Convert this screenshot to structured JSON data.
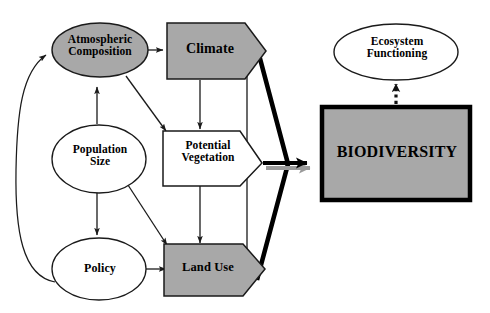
{
  "diagram": {
    "width": 490,
    "height": 313,
    "background_color": "#ffffff",
    "shape_fill_gray": "#a8a8a8",
    "shape_fill_white": "#ffffff",
    "stroke_color": "#000000",
    "accent_black": "#000000",
    "shadow_gray": "#9a9a9a"
  },
  "nodes": {
    "atmospheric_composition": {
      "label": "Atmospheric\nComposition",
      "shape": "ellipse",
      "fill": "#a8a8a8"
    },
    "population_size": {
      "label": "Population\nSize",
      "shape": "ellipse",
      "fill": "#ffffff"
    },
    "policy": {
      "label": "Policy",
      "shape": "ellipse",
      "fill": "#ffffff"
    },
    "climate": {
      "label": "Climate",
      "shape": "pentagon-arrow",
      "fill": "#a8a8a8"
    },
    "potential_vegetation": {
      "label": "Potential\nVegetation",
      "shape": "pentagon-arrow",
      "fill": "#ffffff"
    },
    "land_use": {
      "label": "Land Use",
      "shape": "pentagon-arrow",
      "fill": "#a8a8a8"
    },
    "biodiversity": {
      "label": "BIODIVERSITY",
      "shape": "rectangle",
      "fill": "#a8a8a8"
    },
    "ecosystem_functioning": {
      "label": "Ecosystem\nFunctioning",
      "shape": "ellipse",
      "fill": "#ffffff"
    }
  },
  "edges": [
    {
      "from": "atmospheric_composition",
      "to": "climate",
      "style": "solid-arrow"
    },
    {
      "from": "atmospheric_composition",
      "to": "potential_vegetation",
      "style": "solid-arrow"
    },
    {
      "from": "population_size",
      "to": "atmospheric_composition",
      "style": "solid-arrow"
    },
    {
      "from": "population_size",
      "to": "policy",
      "style": "solid-arrow"
    },
    {
      "from": "population_size",
      "to": "land_use",
      "style": "solid-arrow"
    },
    {
      "from": "policy",
      "to": "land_use",
      "style": "solid-arrow"
    },
    {
      "from": "policy",
      "to": "atmospheric_composition",
      "style": "curved-feedback-arrow"
    },
    {
      "from": "climate",
      "to": "potential_vegetation",
      "style": "solid-arrow"
    },
    {
      "from": "potential_vegetation",
      "to": "land_use",
      "style": "solid-arrow"
    },
    {
      "from": "climate",
      "to": "land_use",
      "style": "double-headed-arrow"
    },
    {
      "from": "potential_vegetation",
      "to": "biodiversity",
      "style": "thick-arrow-with-shadow"
    },
    {
      "from": "biodiversity",
      "to": "ecosystem_functioning",
      "style": "dotted-arrow"
    }
  ]
}
